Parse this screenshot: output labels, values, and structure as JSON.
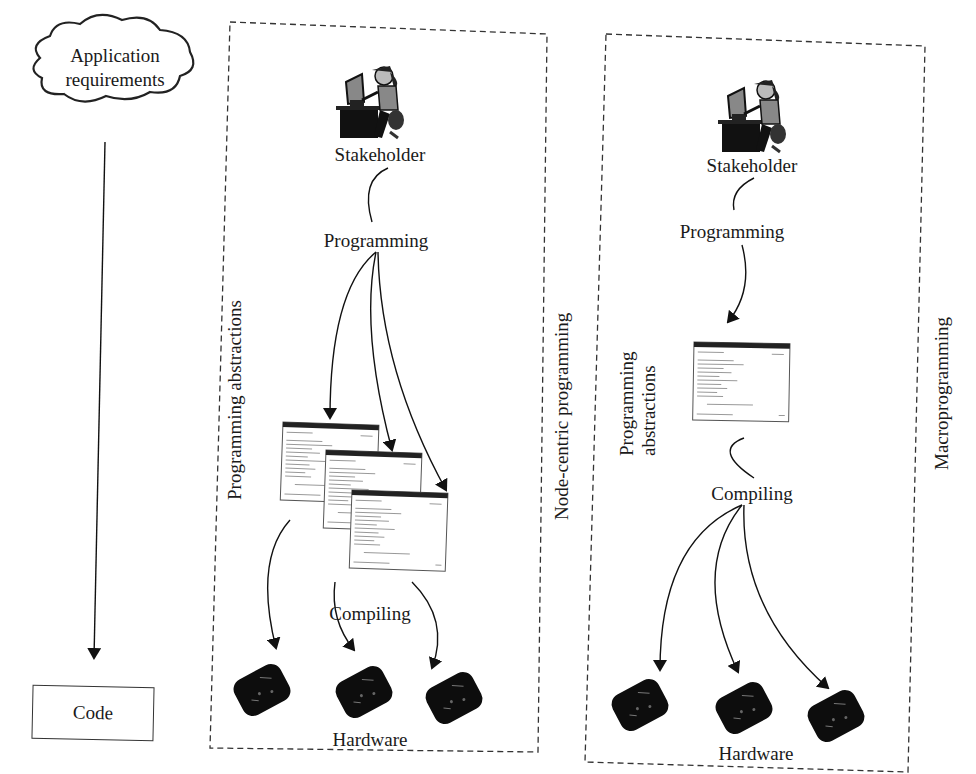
{
  "left_flow": {
    "start": "Application requirements",
    "end": "Code"
  },
  "node_centric": {
    "title": "Node-centric programming",
    "actor": "Stakeholder",
    "step1": "Programming",
    "abstractions_label": "Programming abstractions",
    "step2": "Compiling",
    "target": "Hardware",
    "program_windows": 3,
    "devices": 3
  },
  "macroprogramming": {
    "title": "Macroprogramming",
    "actor": "Stakeholder",
    "step1": "Programming",
    "abstractions_label": "Programming abstractions",
    "step2": "Compiling",
    "target": "Hardware",
    "program_windows": 1,
    "devices": 3
  },
  "icons": {
    "actor": "person-at-computer-icon",
    "program": "code-window-icon",
    "device": "sensor-node-icon",
    "requirements": "cloud-icon"
  }
}
